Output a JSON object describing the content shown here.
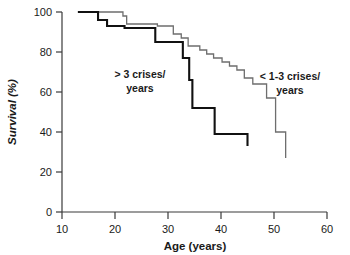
{
  "chart_data": {
    "type": "line",
    "title": "",
    "subtitle": "",
    "xlabel": "Age (years)",
    "ylabel": "Survival (%)",
    "xlim": [
      10,
      60
    ],
    "ylim": [
      0,
      100
    ],
    "xticks": [
      10,
      20,
      30,
      40,
      50,
      60
    ],
    "yticks": [
      0,
      20,
      40,
      60,
      80,
      100
    ],
    "xtick_labels": [
      "10",
      "20",
      "30",
      "40",
      "50",
      "60"
    ],
    "ytick_labels": [
      "0",
      "20",
      "40",
      "60",
      "80",
      "100"
    ],
    "grid": false,
    "legend": "inline-annotations",
    "step_style": "post",
    "series": [
      {
        "name": "> 3 crises/ years",
        "annotation_line1": "> 3 crises/",
        "annotation_line2": "years",
        "color": "#111111",
        "line_width": "thick",
        "points": [
          [
            13.0,
            100
          ],
          [
            16.8,
            100
          ],
          [
            16.8,
            96
          ],
          [
            18.5,
            96
          ],
          [
            18.5,
            93
          ],
          [
            21.8,
            93
          ],
          [
            21.8,
            92
          ],
          [
            27.6,
            92
          ],
          [
            27.6,
            85
          ],
          [
            32.8,
            85
          ],
          [
            32.8,
            77
          ],
          [
            34.0,
            77
          ],
          [
            34.0,
            66
          ],
          [
            34.6,
            66
          ],
          [
            34.6,
            52
          ],
          [
            38.8,
            52
          ],
          [
            38.8,
            39
          ],
          [
            45.0,
            39
          ],
          [
            45.0,
            33
          ]
        ]
      },
      {
        "name": "< 1-3 crises/ years",
        "annotation_line1": "< 1-3 crises/",
        "annotation_line2": "years",
        "color": "#6e6e6e",
        "line_width": "thin",
        "points": [
          [
            13.0,
            100
          ],
          [
            21.5,
            100
          ],
          [
            21.5,
            98
          ],
          [
            22.2,
            98
          ],
          [
            22.2,
            94
          ],
          [
            28.0,
            94
          ],
          [
            28.0,
            93
          ],
          [
            31.0,
            93
          ],
          [
            31.0,
            89
          ],
          [
            32.5,
            89
          ],
          [
            32.5,
            87
          ],
          [
            33.8,
            87
          ],
          [
            33.8,
            83
          ],
          [
            36.0,
            83
          ],
          [
            36.0,
            81
          ],
          [
            37.3,
            81
          ],
          [
            37.3,
            79
          ],
          [
            38.6,
            79
          ],
          [
            38.6,
            77
          ],
          [
            40.2,
            77
          ],
          [
            40.2,
            75
          ],
          [
            41.6,
            75
          ],
          [
            41.6,
            73
          ],
          [
            43.0,
            73
          ],
          [
            43.0,
            71
          ],
          [
            44.4,
            71
          ],
          [
            44.4,
            67
          ],
          [
            46.0,
            67
          ],
          [
            46.0,
            64
          ],
          [
            48.6,
            64
          ],
          [
            48.6,
            57
          ],
          [
            50.3,
            57
          ],
          [
            50.3,
            40
          ],
          [
            52.2,
            40
          ],
          [
            52.2,
            27
          ]
        ]
      }
    ],
    "annotations": [
      {
        "text_line1": "> 3 crises/",
        "text_line2": "years",
        "x": 25.5,
        "y": 68
      },
      {
        "text_line1": "< 1-3 crises/",
        "text_line2": "years",
        "x": 49.5,
        "y": 70
      }
    ]
  }
}
